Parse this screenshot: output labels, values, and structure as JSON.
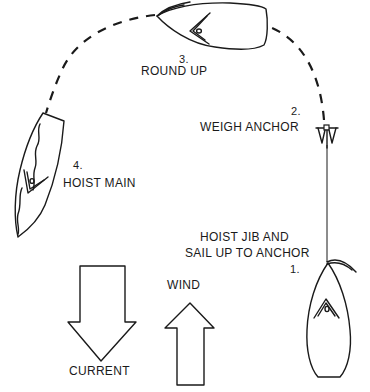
{
  "diagram": {
    "steps": [
      {
        "number": "1.",
        "label_line1": "HOIST JIB AND",
        "label_line2": "SAIL UP TO ANCHOR"
      },
      {
        "number": "2.",
        "label": "WEIGH ANCHOR"
      },
      {
        "number": "3.",
        "label": "ROUND UP"
      },
      {
        "number": "4.",
        "label": "HOIST MAIN"
      }
    ],
    "arrows": {
      "current": {
        "label": "CURRENT",
        "direction": "down"
      },
      "wind": {
        "label": "WIND",
        "direction": "up"
      }
    },
    "colors": {
      "ink": "#1a1a1a",
      "background": "#ffffff"
    }
  }
}
